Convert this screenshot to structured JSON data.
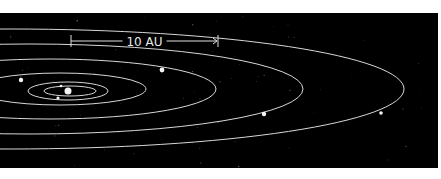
{
  "diagram": {
    "background_color": "#000000",
    "page_color": "#ffffff",
    "orbit_color": "#d8d8d8",
    "body_color": "#f4f4f4",
    "panel": {
      "x": 0,
      "y": 13,
      "width": 438,
      "height": 155
    },
    "scale_bar": {
      "label": "10 AU",
      "x_start": 71,
      "x_end": 218,
      "y": 41
    },
    "sun": {
      "x": 68,
      "y": 91,
      "r": 3.5
    },
    "orbits": [
      {
        "name": "orbit-1",
        "cx": 70,
        "cy": 91,
        "rx": 26,
        "ry": 5
      },
      {
        "name": "orbit-2",
        "cx": 68,
        "cy": 91,
        "rx": 40,
        "ry": 9
      },
      {
        "name": "orbit-3",
        "cx": 60,
        "cy": 89,
        "rx": 86,
        "ry": 16
      },
      {
        "name": "orbit-4",
        "cx": 50,
        "cy": 89,
        "rx": 166,
        "ry": 30
      },
      {
        "name": "orbit-5",
        "cx": 30,
        "cy": 89,
        "rx": 273,
        "ry": 45
      },
      {
        "name": "orbit-6",
        "cx": 10,
        "cy": 89,
        "rx": 394,
        "ry": 60
      }
    ],
    "planets": [
      {
        "name": "planet-1",
        "x": 61,
        "y": 86,
        "r": 1.3
      },
      {
        "name": "planet-2",
        "x": 58,
        "y": 98,
        "r": 1.6
      },
      {
        "name": "planet-3",
        "x": 21,
        "y": 80,
        "r": 2.2
      },
      {
        "name": "planet-4",
        "x": 162,
        "y": 70,
        "r": 2.4
      },
      {
        "name": "planet-5",
        "x": 264,
        "y": 114,
        "r": 2.2
      },
      {
        "name": "planet-6",
        "x": 381,
        "y": 113,
        "r": 1.8
      }
    ]
  }
}
